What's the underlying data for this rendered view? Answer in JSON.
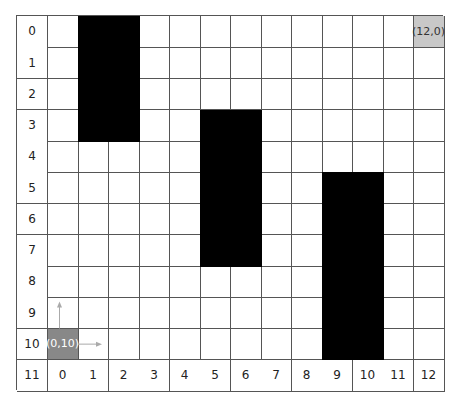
{
  "grid": {
    "cols": 13,
    "rows": 11,
    "row_labels": [
      "0",
      "1",
      "2",
      "3",
      "4",
      "5",
      "6",
      "7",
      "8",
      "9",
      "10"
    ],
    "corner_label": "11",
    "col_labels": [
      "0",
      "1",
      "2",
      "3",
      "4",
      "5",
      "6",
      "7",
      "8",
      "9",
      "10",
      "11",
      "12"
    ]
  },
  "obstacles": [
    {
      "x": 1,
      "y": 0,
      "w": 2,
      "h": 4
    },
    {
      "x": 5,
      "y": 3,
      "w": 2,
      "h": 5
    },
    {
      "x": 9,
      "y": 5,
      "w": 2,
      "h": 6
    }
  ],
  "markers": [
    {
      "x": 12,
      "y": 0,
      "label": "(12,0)",
      "color": "#c8c8c8",
      "text_color": "#333333"
    },
    {
      "x": 0,
      "y": 10,
      "label": "(0,10)",
      "color": "#888888",
      "text_color": "#ffffff"
    }
  ],
  "axis_arrows": {
    "color": "#aaaaaa"
  }
}
